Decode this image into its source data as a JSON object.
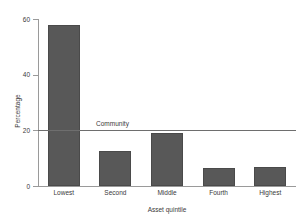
{
  "chart_data": {
    "type": "bar",
    "title": "",
    "xlabel": "Asset quintile",
    "ylabel": "Percentage",
    "categories": [
      "Lowest",
      "Second",
      "Middle",
      "Fourth",
      "Highest"
    ],
    "values": [
      58,
      12.5,
      19,
      6.5,
      7
    ],
    "ylim": [
      0,
      60
    ],
    "yticks": [
      0,
      20,
      40,
      60
    ],
    "ytick_labels": [
      "0",
      "20",
      "40",
      "60"
    ],
    "grid": false,
    "legend": "none",
    "series_color": "#585858",
    "annotations": [
      {
        "label": "Community",
        "type": "horizontal-reference-line",
        "value": 20,
        "line_color": "#6e6e6e",
        "label_x_fraction": 0.225
      }
    ]
  }
}
